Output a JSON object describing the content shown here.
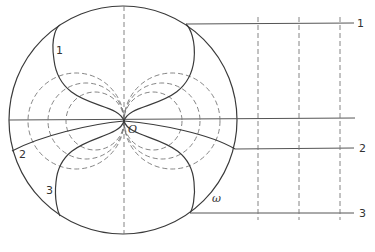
{
  "diagram": {
    "type": "geometric construction",
    "colors": {
      "stroke": "#3a3a3a",
      "dashed": "#777777",
      "background": "#ffffff"
    },
    "labels": {
      "origin": "O",
      "omega": "ω",
      "curve1_left": "1",
      "curve2_left": "2",
      "curve3_left": "3",
      "line1_right": "1",
      "line2_right": "2",
      "line3_right": "3"
    },
    "elements": {
      "outer_circle": "Large circle centered near O",
      "solid_curves": [
        "1 (upper lobe)",
        "2 (horizontal-ish arcs)",
        "3 (lower lobe)"
      ],
      "dashed_circles": "Three pairs of circles tangent to the vertical axis at O",
      "horizontal_lines": [
        "1",
        "axis",
        "2",
        "3"
      ],
      "dashed_verticals": 3
    }
  }
}
